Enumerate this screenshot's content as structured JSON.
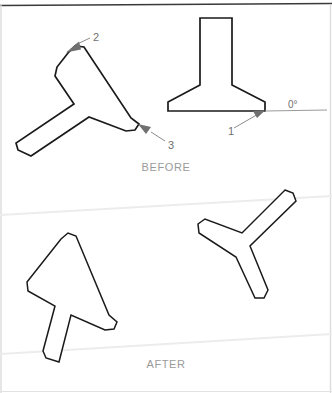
{
  "figure": {
    "width": 332,
    "height": 393,
    "background_color": "#ffffff",
    "outline_color": "#1a1a1a",
    "leader_color": "#8c8c8c",
    "caption_color": "#9a9a9a",
    "label_color": "#6f6f6f",
    "scan_line_color": "#e8e8e8",
    "border_top_color": "#3a3a3a",
    "border_side_color": "#d5d5d5"
  },
  "panels": [
    {
      "id": "before",
      "caption": "BEFORE"
    },
    {
      "id": "after",
      "caption": "AFTER"
    }
  ],
  "captions": {
    "before": "BEFORE",
    "after": "AFTER"
  },
  "callouts": [
    {
      "id": "1",
      "label": "1",
      "target": "reference-edge-of-upright-shape"
    },
    {
      "id": "2",
      "label": "2",
      "target": "upper-apex-of-rotated-shape"
    },
    {
      "id": "3",
      "label": "3",
      "target": "lower-right-tip-of-rotated-shape"
    }
  ],
  "angle_reference": {
    "label": "0°",
    "description": "horizontal zero-degree baseline"
  },
  "shapes": [
    {
      "id": "before-left-rotated-tee",
      "panel": "before",
      "name": "rotated-t-shape",
      "points": "68,53 75,46 84,47 131,118 139,124 135,130 126,131 89,117 31,156 18,150 16,143 74,104 55,76 57,67"
    },
    {
      "id": "before-right-upright-anvil",
      "panel": "before",
      "name": "upright-anvil-shape",
      "points": "200,18 232,18 232,85 265,102 265,111 168,111 168,102 200,85"
    },
    {
      "id": "after-left-tee",
      "panel": "after",
      "name": "upright-rotated-t-shape",
      "points": "61,239 68,233 76,236 109,315 117,322 114,329 105,330 71,315 59,362 46,358 43,351 55,306 28,291 27,282"
    },
    {
      "id": "after-right-tee",
      "panel": "after",
      "name": "tilted-t-shape",
      "points": "285,190 293,193 296,201 250,246 268,290 264,298 255,298 236,257 199,233 198,224 205,219 242,233"
    }
  ],
  "scan_artifacts": [
    {
      "id": "scan-line-upper",
      "description": "faint diagonal page-scan line across upper AFTER area"
    },
    {
      "id": "scan-line-lower",
      "description": "faint diagonal page-scan line across lower AFTER area"
    }
  ]
}
